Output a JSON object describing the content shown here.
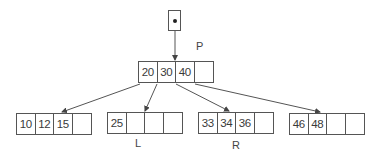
{
  "diagram": {
    "type": "b-tree",
    "root_pointer": {
      "icon": "pointer-dot"
    },
    "root": {
      "label": "P",
      "keys": [
        "20",
        "30",
        "40",
        ""
      ]
    },
    "leaves": [
      {
        "label": "",
        "keys": [
          "10",
          "12",
          "15",
          ""
        ]
      },
      {
        "label": "L",
        "keys": [
          "25",
          "",
          "",
          ""
        ]
      },
      {
        "label": "R",
        "keys": [
          "33",
          "34",
          "36",
          ""
        ]
      },
      {
        "label": "",
        "keys": [
          "46",
          "48",
          "",
          ""
        ]
      }
    ],
    "edges": [
      {
        "from": "root-pointer",
        "to": "root"
      },
      {
        "from": "root.child0",
        "to": "leaf0"
      },
      {
        "from": "root.child1",
        "to": "leaf1"
      },
      {
        "from": "root.child2",
        "to": "leaf2"
      },
      {
        "from": "root.child3",
        "to": "leaf3"
      }
    ],
    "colors": {
      "line": "#555555",
      "text": "#3a3a3a",
      "background": "#ffffff"
    }
  }
}
